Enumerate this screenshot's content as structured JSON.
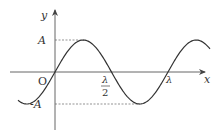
{
  "figure": {
    "type": "sine-wave",
    "axes": {
      "x_label": "x",
      "y_label": "y",
      "origin_label": "O"
    },
    "y_ticks": [
      {
        "label": "A",
        "value": "A"
      },
      {
        "label": "-A",
        "value": "-A"
      }
    ],
    "x_ticks": [
      {
        "label_num": "λ",
        "label_den": "2",
        "value": "λ/2"
      },
      {
        "label": "λ",
        "value": "λ"
      }
    ],
    "colors": {
      "curve": "#333333",
      "axis": "#444444",
      "dashed": "#555555"
    }
  },
  "chart_data": {
    "type": "line",
    "title": "",
    "xlabel": "x",
    "ylabel": "y",
    "function": "y = A sin(2πx/λ)",
    "x": [
      "-λ/4",
      "0",
      "λ/4",
      "λ/2",
      "3λ/4",
      "λ",
      "5λ/4",
      "3λ/2"
    ],
    "values": [
      "-A",
      "0",
      "A",
      "0",
      "-A",
      "0",
      "A",
      "0"
    ],
    "x_ticks": [
      "O",
      "λ/2",
      "λ"
    ],
    "y_ticks": [
      "A",
      "-A"
    ],
    "grid": false
  }
}
